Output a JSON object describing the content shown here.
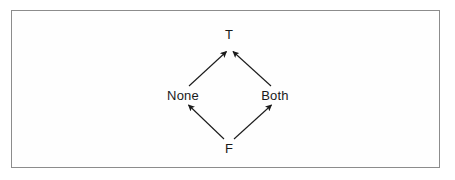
{
  "figure": {
    "kind": "hasse-lattice-diagram",
    "background_color": "#ffffff",
    "border_color": "#8c8c8c",
    "edge_color": "#1a1a1a",
    "label_color": "#1a1a1a",
    "nodes": [
      {
        "id": "top",
        "label": "T",
        "x": 229,
        "y": 34
      },
      {
        "id": "left",
        "label": "None",
        "x": 183,
        "y": 95
      },
      {
        "id": "right",
        "label": "Both",
        "x": 275,
        "y": 95
      },
      {
        "id": "bottom",
        "label": "F",
        "x": 229,
        "y": 148
      }
    ],
    "edges": [
      {
        "id": "none-to-t",
        "from": "left",
        "to": "top",
        "arrowhead": "filled",
        "direction": "up-right"
      },
      {
        "id": "both-to-t",
        "from": "right",
        "to": "top",
        "arrowhead": "filled",
        "direction": "up-left"
      },
      {
        "id": "f-to-none",
        "from": "bottom",
        "to": "left",
        "arrowhead": "filled",
        "direction": "up-left"
      },
      {
        "id": "f-to-both",
        "from": "bottom",
        "to": "right",
        "arrowhead": "filled",
        "direction": "up-right"
      }
    ]
  }
}
